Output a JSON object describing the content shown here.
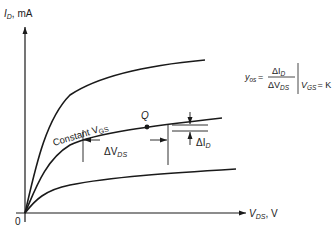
{
  "axes": {
    "y_label_main": "I",
    "y_label_sub": "D",
    "y_label_unit": ", mA",
    "x_label_main": "V",
    "x_label_sub": "DS",
    "x_label_unit": ", V",
    "origin_label": "0"
  },
  "curves": {
    "constant_label_prefix": "Constant V",
    "constant_label_sub": "GS",
    "q_point_label": "Q"
  },
  "annotations": {
    "delta_vds_main": "ΔV",
    "delta_vds_sub": "DS",
    "delta_id_main": "ΔI",
    "delta_id_sub": "D"
  },
  "formula": {
    "lhs_main": "y",
    "lhs_sub": "os",
    "equals": "=",
    "numerator_main": "ΔI",
    "numerator_sub": "D",
    "denominator_main": "ΔV",
    "denominator_sub": "DS",
    "condition_main": "V",
    "condition_sub": "GS",
    "condition_rhs": "= K"
  },
  "colors": {
    "ink": "#1a1a1a",
    "background": "#ffffff"
  }
}
